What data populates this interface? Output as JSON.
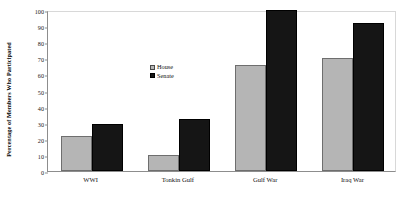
{
  "chart_data": {
    "type": "bar",
    "title": "",
    "xlabel": "",
    "ylabel": "Percentage of Members Who Participated",
    "categories": [
      "WWI",
      "Tonkin Gulf",
      "Gulf War",
      "Iraq War"
    ],
    "series": [
      {
        "name": "House",
        "color": "#b5b5b5",
        "values": [
          22,
          10,
          66,
          70
        ]
      },
      {
        "name": "Senate",
        "color": "#151515",
        "values": [
          29,
          32,
          100,
          92
        ]
      }
    ],
    "ylim": [
      0,
      100
    ],
    "y_ticks": [
      0,
      10,
      20,
      30,
      40,
      50,
      60,
      70,
      80,
      90,
      100
    ],
    "y_tick_labels": [
      "0",
      "10",
      "20",
      "30",
      "40",
      "50",
      "60",
      "70",
      "80",
      "90",
      "100"
    ],
    "grid": false,
    "legend_position": "center-left-inside",
    "legend_entries": [
      "House",
      "Senate"
    ]
  }
}
